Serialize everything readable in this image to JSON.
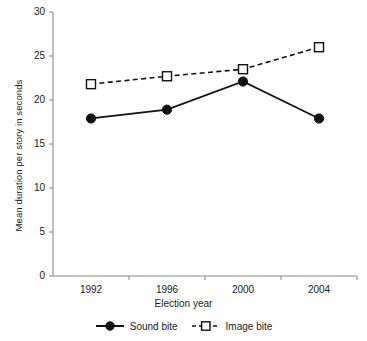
{
  "chart_data": {
    "type": "line",
    "title": "",
    "xlabel": "Election year",
    "ylabel": "Mean duration per story in seconds",
    "categories": [
      "1992",
      "1996",
      "2000",
      "2004"
    ],
    "ylim": [
      0,
      30
    ],
    "yticks": [
      0,
      5,
      10,
      15,
      20,
      25,
      30
    ],
    "ytick_labels": [
      "0",
      "5",
      "10",
      "15",
      "20",
      "25",
      "30"
    ],
    "grid": false,
    "legend_position": "below-axis",
    "series": [
      {
        "name": "Sound bite",
        "values": [
          17.9,
          18.9,
          22.1,
          17.9
        ],
        "marker": "filled-circle",
        "line_style": "solid",
        "color": "#111111"
      },
      {
        "name": "Image bite",
        "values": [
          21.8,
          22.7,
          23.5,
          26.0
        ],
        "marker": "open-square",
        "line_style": "dashed",
        "color": "#111111"
      }
    ]
  },
  "legend": {
    "items": [
      {
        "label": "Sound bite"
      },
      {
        "label": "Image bite"
      }
    ]
  },
  "colors": {
    "axis": "#8a8a8a",
    "series": "#111111",
    "background": "#ffffff"
  }
}
